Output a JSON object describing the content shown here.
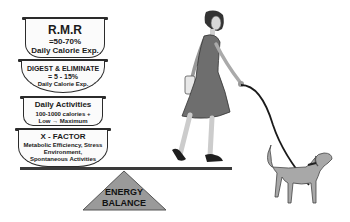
{
  "bowls": [
    {
      "title": "R.M.R",
      "line2": "=50-70%",
      "line3": "Daily Calorie Exp."
    },
    {
      "title": "DIGEST & ELIMINATE",
      "line2": "= 5 - 15%",
      "line3": "Daily Calorie Exp."
    },
    {
      "title": "Daily Activities",
      "line2": "100-1000 calories +",
      "line3": "Low → Maximum"
    },
    {
      "title": "X - FACTOR",
      "line2": "Metabolic Efficiency, Stress",
      "line3": "Environment,",
      "line4": "Spontaneous Activities"
    }
  ],
  "fulcrum": {
    "line1": "ENERGY",
    "line2": "BALANCE"
  },
  "figures": {
    "person": "woman-walking-icon",
    "dog": "dog-on-leash-icon"
  },
  "colors": {
    "outline": "#2b2b2b",
    "fulcrum_fill": "#9a9a9a",
    "dress": "#6e6e6e",
    "dog": "#a8a8a8"
  }
}
